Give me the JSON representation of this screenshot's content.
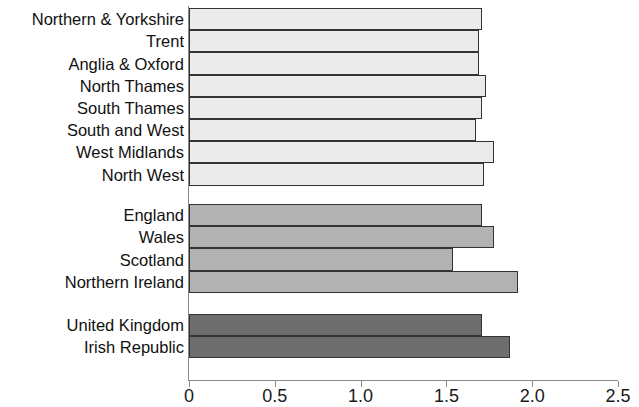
{
  "chart_data": {
    "type": "bar",
    "orientation": "horizontal",
    "title": "",
    "subtitle": "",
    "xlabel": "",
    "ylabel": "",
    "xlim": [
      0,
      2.5
    ],
    "grid": false,
    "legend": "none",
    "axis": {
      "ticks": [
        {
          "value": 0,
          "label": "0"
        },
        {
          "value": 0.5,
          "label": "0.5"
        },
        {
          "value": 1.0,
          "label": "1.0"
        },
        {
          "value": 1.5,
          "label": "1.5"
        },
        {
          "value": 2.0,
          "label": "2.0"
        },
        {
          "value": 2.5,
          "label": "2.5"
        }
      ]
    },
    "groups": [
      {
        "name": "English regions",
        "color": "#ebebeb",
        "categories": [
          "Northern & Yorkshire",
          "Trent",
          "Anglia & Oxford",
          "North Thames",
          "South Thames",
          "South and West",
          "West Midlands",
          "North West"
        ],
        "values": [
          1.71,
          1.69,
          1.69,
          1.73,
          1.71,
          1.67,
          1.78,
          1.72
        ]
      },
      {
        "name": "UK countries",
        "color": "#b2b2b2",
        "categories": [
          "England",
          "Wales",
          "Scotland",
          "Northern Ireland"
        ],
        "values": [
          1.71,
          1.78,
          1.54,
          1.92
        ]
      },
      {
        "name": "National totals",
        "color": "#6e6e6e",
        "categories": [
          "United Kingdom",
          "Irish Republic"
        ],
        "values": [
          1.71,
          1.87
        ]
      }
    ],
    "categories": [
      "Northern & Yorkshire",
      "Trent",
      "Anglia & Oxford",
      "North Thames",
      "South Thames",
      "South and West",
      "West Midlands",
      "North West",
      "England",
      "Wales",
      "Scotland",
      "Northern Ireland",
      "United Kingdom",
      "Irish Republic"
    ],
    "values": [
      1.71,
      1.69,
      1.69,
      1.73,
      1.71,
      1.67,
      1.78,
      1.72,
      1.71,
      1.78,
      1.54,
      1.92,
      1.71,
      1.87
    ]
  }
}
